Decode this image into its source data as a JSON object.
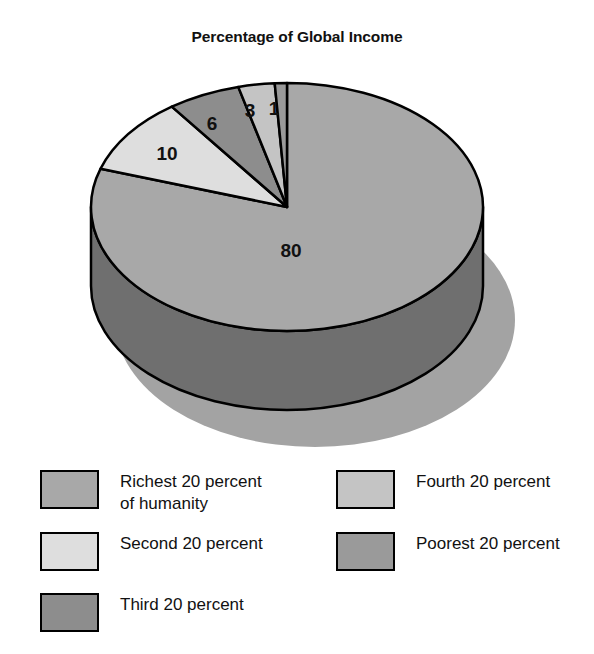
{
  "chart": {
    "title": "Percentage of Global Income"
  },
  "chart_data": {
    "type": "pie",
    "title": "Percentage of Global Income",
    "xlabel": "",
    "ylabel": "",
    "unit": "percent",
    "style": "3d-pie",
    "legend_position": "bottom",
    "grid": false,
    "categories": [
      "Richest 20 percent of humanity",
      "Second 20 percent",
      "Third 20 percent",
      "Fourth 20 percent",
      "Poorest 20 percent"
    ],
    "values": [
      80,
      10,
      6,
      3,
      1
    ],
    "labels": [
      "80",
      "10",
      "6",
      "3",
      "1"
    ],
    "colors": [
      "#a8a8a8",
      "#dedede",
      "#8d8d8d",
      "#c4c4c4",
      "#9a9a9a"
    ]
  },
  "slices": [
    {
      "name": "richest",
      "label": "80",
      "value": 80,
      "color": "#a8a8a8",
      "side_color": "#6f6f6f",
      "label_x": 291,
      "label_y": 252
    },
    {
      "name": "second",
      "label": "10",
      "value": 10,
      "color": "#dedede",
      "side_color": "#9a9a9a",
      "label_x": 167,
      "label_y": 155
    },
    {
      "name": "third",
      "label": "6",
      "value": 6,
      "color": "#8d8d8d",
      "side_color": "#5f5f5f",
      "label_x": 212,
      "label_y": 125
    },
    {
      "name": "fourth",
      "label": "3",
      "value": 3,
      "color": "#c4c4c4",
      "side_color": "#8a8a8a",
      "label_x": 250,
      "label_y": 112
    },
    {
      "name": "poorest",
      "label": "1",
      "value": 1,
      "color": "#9a9a9a",
      "side_color": "#6a6a6a",
      "label_x": 274,
      "label_y": 110
    }
  ],
  "legend": {
    "left_column": [
      {
        "name": "richest",
        "label": "Richest 20 percent\nof humanity",
        "color": "#a8a8a8"
      },
      {
        "name": "second",
        "label": "Second 20 percent",
        "color": "#dedede"
      },
      {
        "name": "third",
        "label": "Third 20 percent",
        "color": "#8d8d8d"
      }
    ],
    "right_column": [
      {
        "name": "fourth",
        "label": "Fourth 20 percent",
        "color": "#c4c4c4"
      },
      {
        "name": "poorest",
        "label": "Poorest 20 percent",
        "color": "#9a9a9a"
      }
    ]
  },
  "palette": {
    "background": "#ffffff",
    "outline": "#000000",
    "shadow": "#a3a3a3",
    "text": "#111111"
  }
}
